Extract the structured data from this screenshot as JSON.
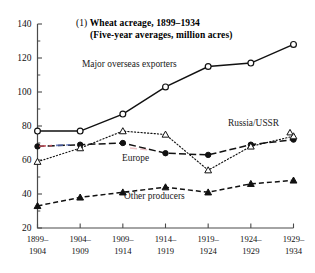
{
  "figure": {
    "number": "(1)",
    "title": "Wheat acreage, 1899–1934",
    "subtitle": "(Five-year averages, million acres)",
    "ghost_text": ""
  },
  "chart_data": {
    "type": "line",
    "title": "Wheat acreage, 1899–1934",
    "subtitle": "(Five-year averages, million acres)",
    "xlabel": "",
    "ylabel": "",
    "ylim": [
      20,
      140
    ],
    "ytick_step": 20,
    "yminor_step": 10,
    "grid": false,
    "legend": "inline-annotations",
    "categories": [
      "1899–1904",
      "1904–1909",
      "1909–1914",
      "1914–1919",
      "1919–1924",
      "1924–1929",
      "1929–1934"
    ],
    "category_lines": [
      [
        "1899–",
        "1904"
      ],
      [
        "1904–",
        "1909"
      ],
      [
        "1909–",
        "1914"
      ],
      [
        "1914–",
        "1919"
      ],
      [
        "1919–",
        "1924"
      ],
      [
        "1924–",
        "1929"
      ],
      [
        "1929–",
        "1934"
      ]
    ],
    "yticks": [
      20,
      40,
      60,
      80,
      100,
      120,
      140
    ],
    "series": [
      {
        "name": "Major overseas exporters",
        "marker": "open-circle",
        "line": "solid",
        "values": [
          77,
          77,
          87,
          103,
          115,
          117,
          128
        ]
      },
      {
        "name": "Europe",
        "marker": "filled-circle",
        "line": "long-dash",
        "values": [
          68,
          69,
          70,
          64,
          63,
          69,
          72
        ]
      },
      {
        "name": "Russia/USSR",
        "marker": "open-triangle",
        "line": "dotted",
        "values": [
          59,
          67,
          77,
          75,
          54,
          68,
          74
        ]
      },
      {
        "name": "Other producers",
        "marker": "filled-triangle",
        "line": "dash",
        "values": [
          33,
          38,
          41,
          44,
          41,
          46,
          48
        ]
      }
    ],
    "annotations": [
      {
        "text": "Major overseas exporters",
        "x_px": 82,
        "y_px": 67
      },
      {
        "text": "Europe",
        "x_px": 122,
        "y_px": 161
      },
      {
        "text": "Russia/USSR",
        "x_px": 228,
        "y_px": 126
      },
      {
        "text": "Other producers",
        "x_px": 124,
        "y_px": 199
      }
    ]
  }
}
